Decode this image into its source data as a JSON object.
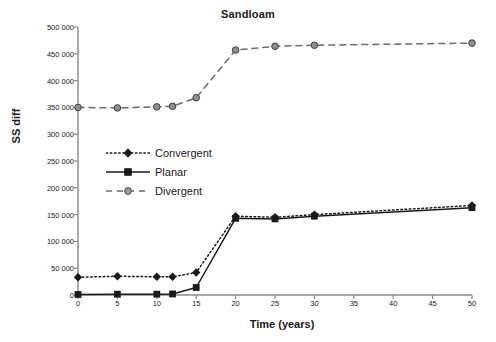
{
  "chart_data": {
    "type": "line",
    "title": "Sandloam",
    "xlabel": "Time (years)",
    "ylabel": "SS diff",
    "grid": false,
    "legend_position": "inside-left-middle",
    "x": [
      0,
      5,
      10,
      12,
      15,
      20,
      25,
      30,
      50
    ],
    "xlim": [
      0,
      50
    ],
    "ylim": [
      0,
      500000
    ],
    "xticks": [
      "0",
      "5",
      "10",
      "15",
      "20",
      "25",
      "30",
      "35",
      "40",
      "45",
      "50"
    ],
    "xtick_values": [
      0,
      5,
      10,
      15,
      20,
      25,
      30,
      35,
      40,
      45,
      50
    ],
    "yticks": [
      "0",
      "50 000",
      "100 000",
      "150 000",
      "200 000",
      "250 000",
      "300 000",
      "350 000",
      "400 000",
      "450 000",
      "500 000"
    ],
    "ytick_values": [
      0,
      50000,
      100000,
      150000,
      200000,
      250000,
      300000,
      350000,
      400000,
      450000,
      500000
    ],
    "series": [
      {
        "name": "Convergent",
        "marker": "diamond",
        "line_style": "dotted",
        "color": "#1a1a1a",
        "values": [
          33000,
          35000,
          34000,
          34000,
          42000,
          147000,
          145000,
          150000,
          167000
        ]
      },
      {
        "name": "Planar",
        "marker": "square",
        "line_style": "solid",
        "color": "#1a1a1a",
        "values": [
          1000,
          1500,
          1500,
          2000,
          14000,
          143000,
          142000,
          147000,
          163000
        ]
      },
      {
        "name": "Divergent",
        "marker": "circle",
        "line_style": "dashed",
        "color": "#6b6b6b",
        "values": [
          350000,
          349000,
          351000,
          352000,
          368000,
          457000,
          464000,
          466000,
          470000
        ]
      }
    ]
  },
  "legend": {
    "items": [
      {
        "label": "Convergent"
      },
      {
        "label": "Planar"
      },
      {
        "label": "Divergent"
      }
    ]
  },
  "colors": {
    "axis": "#8a8a8a",
    "dark": "#1a1a1a",
    "divergent": "#6b6b6b",
    "background": "#ffffff"
  }
}
